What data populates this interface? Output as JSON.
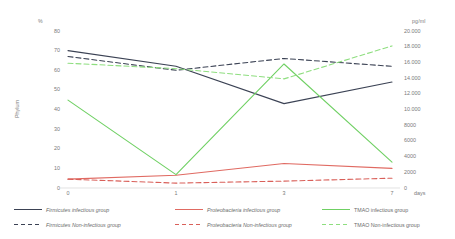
{
  "chart_data": {
    "type": "line",
    "title": "",
    "xlabel": "days",
    "x": [
      0,
      1,
      3,
      7
    ],
    "xticklabels": [
      "0",
      "1",
      "3",
      "7"
    ],
    "left_axis": {
      "label": "Phylum",
      "unit": "%",
      "ylim": [
        0,
        80
      ],
      "ticks": [
        0,
        10,
        20,
        30,
        40,
        50,
        60,
        70,
        80
      ],
      "ticklabels": [
        "0",
        "10",
        "20",
        "30",
        "40",
        "50",
        "60",
        "70",
        "80"
      ]
    },
    "right_axis": {
      "label": "",
      "unit": "pg/ml",
      "ylim": [
        0,
        20000
      ],
      "ticks": [
        0,
        2000,
        4000,
        6000,
        8000,
        10000,
        12000,
        14000,
        16000,
        18000,
        20000
      ],
      "ticklabels": [
        "0",
        "2000",
        "4000",
        "6000",
        "8000",
        "10.000",
        "12.000",
        "14.000",
        "16.000",
        "18.000",
        "20.000"
      ]
    },
    "grid": false,
    "legend_position": "bottom",
    "series": [
      {
        "name": "Firmicutes infectious group",
        "axis": "left",
        "color": "#3b4254",
        "dash": "solid",
        "values": [
          70,
          62,
          43,
          54
        ]
      },
      {
        "name": "Firmicutes Non-infectious group",
        "axis": "left",
        "color": "#3b4254",
        "dash": "dashed",
        "values": [
          67,
          60,
          66,
          62
        ]
      },
      {
        "name": "Proteobacteria infectious group",
        "axis": "left",
        "color": "#e06a62",
        "dash": "solid",
        "values": [
          4.5,
          6.5,
          12.5,
          10
        ]
      },
      {
        "name": "Proteobacteria Non-infectious group",
        "axis": "left",
        "color": "#d9605a",
        "dash": "dashed",
        "values": [
          4.5,
          2.5,
          3.5,
          5
        ]
      },
      {
        "name": "TMAO infectious group",
        "axis": "right",
        "color": "#6fd063",
        "dash": "solid",
        "values": [
          11200,
          1700,
          15800,
          3300
        ]
      },
      {
        "name": "TMAO Non-infectious group",
        "axis": "right",
        "color": "#8ede7f",
        "dash": "dashed",
        "values": [
          15900,
          15200,
          13900,
          18100
        ]
      }
    ]
  },
  "axes": {
    "left_unit": "%",
    "left_title": "Phylum",
    "right_unit": "pg/ml",
    "x_unit": "days"
  },
  "legend": {
    "columns": [
      {
        "rows": [
          {
            "label": "Firmicutes infectious group",
            "color": "#3b4254",
            "dash": "solid"
          },
          {
            "label": "Firmicutes Non-infectious group",
            "color": "#3b4254",
            "dash": "dashed"
          }
        ]
      },
      {
        "rows": [
          {
            "label": "Proteobacteria infectious group",
            "color": "#e06a62",
            "dash": "solid"
          },
          {
            "label": "Proteobacteria Non-infectious group",
            "color": "#d9605a",
            "dash": "dashed"
          }
        ]
      },
      {
        "rows": [
          {
            "label": "TMAO infectious group",
            "color": "#6fd063",
            "dash": "solid"
          },
          {
            "label": "TMAO Non-infectious group",
            "color": "#8ede7f",
            "dash": "dashed"
          }
        ]
      }
    ]
  }
}
